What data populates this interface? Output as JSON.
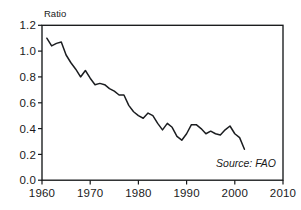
{
  "chart_data": {
    "type": "line",
    "title": "",
    "subtitle": "",
    "xlabel": "",
    "ylabel": "Ratio",
    "ylabel_position": "above-axis-top-left",
    "xlim": [
      1960,
      2010
    ],
    "ylim": [
      0.0,
      1.2
    ],
    "grid": false,
    "legend": null,
    "annotations": [
      {
        "name": "source-note",
        "text": "Source: FAO",
        "x": 2001,
        "y": 0.13,
        "style": "italic",
        "align": "right"
      }
    ],
    "xticks": [
      1960,
      1970,
      1980,
      1990,
      2000,
      2010
    ],
    "xtick_labels": [
      "1960",
      "1970",
      "1980",
      "1990",
      "2000",
      "2010"
    ],
    "yticks": [
      0.0,
      0.2,
      0.4,
      0.6,
      0.8,
      1.0,
      1.2
    ],
    "ytick_labels": [
      "0.0",
      "0.2",
      "0.4",
      "0.6",
      "0.8",
      "1.0",
      "1.2"
    ],
    "series": [
      {
        "name": "ratio",
        "color": "#1b1d20",
        "x": [
          1961,
          1962,
          1963,
          1964,
          1965,
          1966,
          1967,
          1968,
          1969,
          1970,
          1971,
          1972,
          1973,
          1974,
          1975,
          1976,
          1977,
          1978,
          1979,
          1980,
          1981,
          1982,
          1983,
          1984,
          1985,
          1986,
          1987,
          1988,
          1989,
          1990,
          1991,
          1992,
          1993,
          1994,
          1995,
          1996,
          1997,
          1998,
          1999,
          2000,
          2001,
          2002
        ],
        "y": [
          1.1,
          1.04,
          1.06,
          1.07,
          0.97,
          0.91,
          0.86,
          0.8,
          0.85,
          0.79,
          0.74,
          0.75,
          0.74,
          0.71,
          0.69,
          0.66,
          0.66,
          0.58,
          0.53,
          0.5,
          0.48,
          0.52,
          0.5,
          0.44,
          0.39,
          0.44,
          0.41,
          0.34,
          0.31,
          0.36,
          0.43,
          0.43,
          0.4,
          0.36,
          0.38,
          0.36,
          0.35,
          0.39,
          0.42,
          0.36,
          0.33,
          0.24
        ]
      }
    ]
  },
  "axis": {
    "y_label": "Ratio"
  },
  "source": {
    "text": "Source: FAO"
  }
}
